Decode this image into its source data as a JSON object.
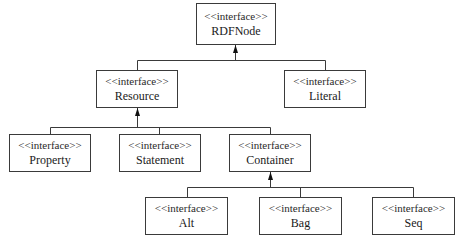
{
  "diagram": {
    "type": "uml-interface-hierarchy",
    "stereotype": "<<interface>>",
    "nodes": [
      {
        "id": "rdfnode",
        "stereotype": "<<interface>>",
        "name": "RDFNode",
        "x": 196,
        "y": 3,
        "w": 80,
        "h": 42
      },
      {
        "id": "resource",
        "stereotype": "<<interface>>",
        "name": "Resource",
        "x": 96,
        "y": 70,
        "w": 82,
        "h": 38
      },
      {
        "id": "literal",
        "stereotype": "<<interface>>",
        "name": "Literal",
        "x": 284,
        "y": 70,
        "w": 82,
        "h": 38
      },
      {
        "id": "property",
        "stereotype": "<<interface>>",
        "name": "Property",
        "x": 9,
        "y": 134,
        "w": 82,
        "h": 38
      },
      {
        "id": "statement",
        "stereotype": "<<interface>>",
        "name": "Statement",
        "x": 119,
        "y": 134,
        "w": 82,
        "h": 38
      },
      {
        "id": "container",
        "stereotype": "<<interface>>",
        "name": "Container",
        "x": 229,
        "y": 134,
        "w": 82,
        "h": 38
      },
      {
        "id": "alt",
        "stereotype": "<<interface>>",
        "name": "Alt",
        "x": 145,
        "y": 197,
        "w": 83,
        "h": 38
      },
      {
        "id": "bag",
        "stereotype": "<<interface>>",
        "name": "Bag",
        "x": 259,
        "y": 197,
        "w": 83,
        "h": 38
      },
      {
        "id": "seq",
        "stereotype": "<<interface>>",
        "name": "Seq",
        "x": 372,
        "y": 197,
        "w": 83,
        "h": 38
      }
    ],
    "edges": [
      {
        "from": "resource",
        "to": "rdfnode",
        "kind": "generalization"
      },
      {
        "from": "literal",
        "to": "rdfnode",
        "kind": "generalization"
      },
      {
        "from": "property",
        "to": "resource",
        "kind": "generalization"
      },
      {
        "from": "statement",
        "to": "resource",
        "kind": "generalization"
      },
      {
        "from": "container",
        "to": "resource",
        "kind": "generalization"
      },
      {
        "from": "alt",
        "to": "container",
        "kind": "generalization"
      },
      {
        "from": "bag",
        "to": "container",
        "kind": "generalization"
      },
      {
        "from": "seq",
        "to": "container",
        "kind": "generalization"
      }
    ]
  }
}
